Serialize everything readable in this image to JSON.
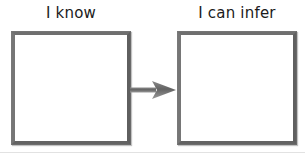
{
  "organizer": {
    "title": "I know / I can infer graphic organizer",
    "arrow": {
      "icon": "arrow-right-icon",
      "direction": "right",
      "color": "#6b6b6b"
    },
    "border_color": "#6f6f6f",
    "fill_color": "#ffffff",
    "columns": [
      {
        "id": "know",
        "label": "I know",
        "box_value": ""
      },
      {
        "id": "infer",
        "label": "I can infer",
        "box_value": ""
      }
    ]
  }
}
